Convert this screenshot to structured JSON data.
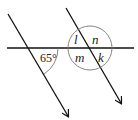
{
  "diagram": {
    "type": "parallel-lines-transversal",
    "given_angle": "65°",
    "angle_labels": [
      "l",
      "n",
      "m",
      "k"
    ],
    "colors": {
      "line": "#111111",
      "arc": "#666666"
    }
  }
}
